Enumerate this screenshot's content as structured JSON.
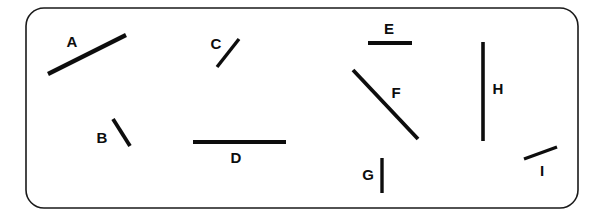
{
  "figure": {
    "background_color": "#ffffff",
    "frame": {
      "name": "rounded-rectangle-border",
      "x": 26,
      "y": 8,
      "width": 552,
      "height": 200,
      "corner_radius": 18,
      "stroke_color": "#1a1a1a",
      "stroke_width": 1.6,
      "fill_color": "#ffffff"
    },
    "line_color": "#0d0d0d",
    "label_color": "#0d0d0d",
    "segments": [
      {
        "label": "A",
        "x1": 48,
        "y1": 74,
        "x2": 126,
        "y2": 35,
        "stroke_width": 4.2,
        "orientation_deg": 26.6,
        "label_x": 72,
        "label_y": 43
      },
      {
        "label": "B",
        "x1": 113,
        "y1": 119,
        "x2": 130,
        "y2": 146,
        "stroke_width": 3.8,
        "orientation_deg": -57.8,
        "label_x": 102,
        "label_y": 139
      },
      {
        "label": "C",
        "x1": 217,
        "y1": 67,
        "x2": 239,
        "y2": 39,
        "stroke_width": 3.4,
        "orientation_deg": 51.8,
        "label_x": 216,
        "label_y": 45
      },
      {
        "label": "D",
        "x1": 193,
        "y1": 142,
        "x2": 286,
        "y2": 142,
        "stroke_width": 4.0,
        "orientation_deg": 0,
        "label_x": 236,
        "label_y": 159
      },
      {
        "label": "E",
        "x1": 368,
        "y1": 43,
        "x2": 412,
        "y2": 43,
        "stroke_width": 4.0,
        "orientation_deg": 0,
        "label_x": 389,
        "label_y": 30
      },
      {
        "label": "F",
        "x1": 353,
        "y1": 70,
        "x2": 418,
        "y2": 139,
        "stroke_width": 3.8,
        "orientation_deg": -46.7,
        "label_x": 396,
        "label_y": 94
      },
      {
        "label": "G",
        "x1": 382,
        "y1": 158,
        "x2": 382,
        "y2": 193,
        "stroke_width": 3.4,
        "orientation_deg": 90,
        "label_x": 368,
        "label_y": 176
      },
      {
        "label": "H",
        "x1": 483,
        "y1": 42,
        "x2": 483,
        "y2": 141,
        "stroke_width": 3.6,
        "orientation_deg": 90,
        "label_x": 498,
        "label_y": 90
      },
      {
        "label": "I",
        "x1": 524,
        "y1": 159,
        "x2": 557,
        "y2": 147,
        "stroke_width": 3.4,
        "orientation_deg": 20.0,
        "label_x": 542,
        "label_y": 172
      }
    ]
  }
}
